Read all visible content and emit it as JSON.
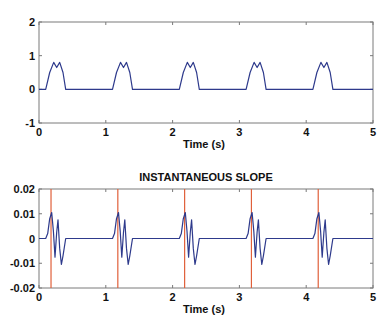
{
  "colors": {
    "signal": "#2e3a8c",
    "marker": "#e0603a",
    "axes": "#7a7a7a",
    "text": "#111111"
  },
  "chart_data": [
    {
      "type": "line",
      "title": "",
      "xlabel": "Time (s)",
      "ylabel": "",
      "xlim": [
        0,
        5
      ],
      "ylim": [
        -1,
        2
      ],
      "xticks": [
        0,
        1,
        2,
        3,
        4,
        5
      ],
      "yticks": [
        -1,
        0,
        1,
        2
      ],
      "xtick_labels": [
        "0",
        "1",
        "2",
        "3",
        "4",
        "5"
      ],
      "ytick_labels": [
        "-1",
        "0",
        "1",
        "2"
      ],
      "grid": false,
      "series": [
        {
          "name": "signal",
          "period": 1.0,
          "pulse_x": [
            0.0,
            0.1,
            0.16,
            0.22,
            0.265,
            0.31,
            0.36,
            0.4,
            1.0
          ],
          "pulse_y": [
            0,
            0,
            0.5,
            0.8,
            0.65,
            0.8,
            0.5,
            0,
            0
          ],
          "cycles": 5
        }
      ]
    },
    {
      "type": "line",
      "title": "INSTANTANEOUS SLOPE",
      "xlabel": "Time (s)",
      "ylabel": "",
      "xlim": [
        0,
        5
      ],
      "ylim": [
        -0.02,
        0.02
      ],
      "xticks": [
        0,
        1,
        2,
        3,
        4,
        5
      ],
      "yticks": [
        -0.02,
        -0.01,
        0,
        0.01,
        0.02
      ],
      "xtick_labels": [
        "0",
        "1",
        "2",
        "3",
        "4",
        "5"
      ],
      "ytick_labels": [
        "-0.02",
        "-0.01",
        "0",
        "0.01",
        "0.02"
      ],
      "grid": false,
      "series": [
        {
          "name": "slope",
          "period": 1.0,
          "pulse_x": [
            0.0,
            0.1,
            0.13,
            0.16,
            0.19,
            0.215,
            0.24,
            0.265,
            0.285,
            0.31,
            0.335,
            0.36,
            0.4,
            1.0
          ],
          "pulse_y": [
            0,
            0,
            0.002,
            0.008,
            0.0105,
            0.003,
            -0.0075,
            0.0025,
            0.0075,
            -0.004,
            -0.0105,
            -0.007,
            0,
            0
          ],
          "cycles": 5
        }
      ],
      "vertical_markers": [
        0.18,
        1.18,
        2.18,
        3.18,
        4.18
      ]
    }
  ]
}
